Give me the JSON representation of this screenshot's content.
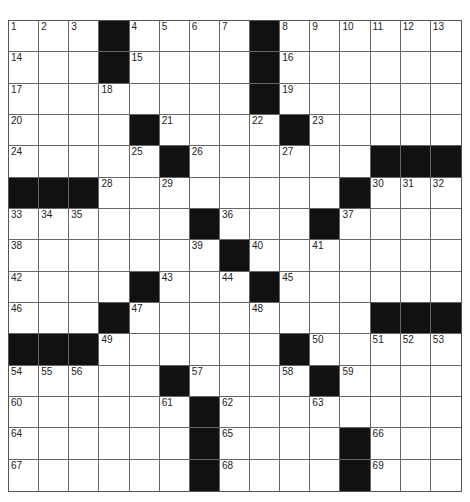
{
  "puzzle": {
    "rows": 15,
    "cols": 15,
    "colors": {
      "block": "#111111",
      "cell": "#ffffff",
      "line": "#666666"
    },
    "grid": [
      "...#....#......",
      "...#....#......",
      "........#......",
      "....#....#.....",
      ".....#......###",
      "###........#...",
      "......#...#....",
      ".......#.......",
      "....#...#......",
      "...#........###",
      "###......#.....",
      ".....#....#....",
      "......#........",
      "......#....#...",
      "......#....#..."
    ],
    "numbers": [
      {
        "r": 0,
        "c": 0,
        "n": "1"
      },
      {
        "r": 0,
        "c": 1,
        "n": "2"
      },
      {
        "r": 0,
        "c": 2,
        "n": "3"
      },
      {
        "r": 0,
        "c": 4,
        "n": "4"
      },
      {
        "r": 0,
        "c": 5,
        "n": "5"
      },
      {
        "r": 0,
        "c": 6,
        "n": "6"
      },
      {
        "r": 0,
        "c": 7,
        "n": "7"
      },
      {
        "r": 0,
        "c": 9,
        "n": "8"
      },
      {
        "r": 0,
        "c": 10,
        "n": "9"
      },
      {
        "r": 0,
        "c": 11,
        "n": "10"
      },
      {
        "r": 0,
        "c": 12,
        "n": "11"
      },
      {
        "r": 0,
        "c": 13,
        "n": "12"
      },
      {
        "r": 0,
        "c": 14,
        "n": "13"
      },
      {
        "r": 1,
        "c": 0,
        "n": "14"
      },
      {
        "r": 1,
        "c": 4,
        "n": "15"
      },
      {
        "r": 1,
        "c": 9,
        "n": "16"
      },
      {
        "r": 2,
        "c": 0,
        "n": "17"
      },
      {
        "r": 2,
        "c": 3,
        "n": "18"
      },
      {
        "r": 2,
        "c": 9,
        "n": "19"
      },
      {
        "r": 3,
        "c": 0,
        "n": "20"
      },
      {
        "r": 3,
        "c": 5,
        "n": "21"
      },
      {
        "r": 3,
        "c": 8,
        "n": "22"
      },
      {
        "r": 3,
        "c": 10,
        "n": "23"
      },
      {
        "r": 4,
        "c": 0,
        "n": "24"
      },
      {
        "r": 4,
        "c": 4,
        "n": "25"
      },
      {
        "r": 4,
        "c": 6,
        "n": "26"
      },
      {
        "r": 4,
        "c": 9,
        "n": "27"
      },
      {
        "r": 5,
        "c": 3,
        "n": "28"
      },
      {
        "r": 5,
        "c": 5,
        "n": "29"
      },
      {
        "r": 5,
        "c": 12,
        "n": "30"
      },
      {
        "r": 5,
        "c": 13,
        "n": "31"
      },
      {
        "r": 5,
        "c": 14,
        "n": "32"
      },
      {
        "r": 6,
        "c": 0,
        "n": "33"
      },
      {
        "r": 6,
        "c": 1,
        "n": "34"
      },
      {
        "r": 6,
        "c": 2,
        "n": "35"
      },
      {
        "r": 6,
        "c": 7,
        "n": "36"
      },
      {
        "r": 6,
        "c": 11,
        "n": "37"
      },
      {
        "r": 7,
        "c": 0,
        "n": "38"
      },
      {
        "r": 7,
        "c": 6,
        "n": "39"
      },
      {
        "r": 7,
        "c": 8,
        "n": "40"
      },
      {
        "r": 7,
        "c": 10,
        "n": "41"
      },
      {
        "r": 8,
        "c": 0,
        "n": "42"
      },
      {
        "r": 8,
        "c": 5,
        "n": "43"
      },
      {
        "r": 8,
        "c": 7,
        "n": "44"
      },
      {
        "r": 8,
        "c": 9,
        "n": "45"
      },
      {
        "r": 9,
        "c": 0,
        "n": "46"
      },
      {
        "r": 9,
        "c": 4,
        "n": "47"
      },
      {
        "r": 9,
        "c": 8,
        "n": "48"
      },
      {
        "r": 10,
        "c": 3,
        "n": "49"
      },
      {
        "r": 10,
        "c": 10,
        "n": "50"
      },
      {
        "r": 10,
        "c": 12,
        "n": "51"
      },
      {
        "r": 10,
        "c": 13,
        "n": "52"
      },
      {
        "r": 10,
        "c": 14,
        "n": "53"
      },
      {
        "r": 11,
        "c": 0,
        "n": "54"
      },
      {
        "r": 11,
        "c": 1,
        "n": "55"
      },
      {
        "r": 11,
        "c": 2,
        "n": "56"
      },
      {
        "r": 11,
        "c": 6,
        "n": "57"
      },
      {
        "r": 11,
        "c": 9,
        "n": "58"
      },
      {
        "r": 11,
        "c": 11,
        "n": "59"
      },
      {
        "r": 12,
        "c": 0,
        "n": "60"
      },
      {
        "r": 12,
        "c": 5,
        "n": "61"
      },
      {
        "r": 12,
        "c": 7,
        "n": "62"
      },
      {
        "r": 12,
        "c": 10,
        "n": "63"
      },
      {
        "r": 13,
        "c": 0,
        "n": "64"
      },
      {
        "r": 13,
        "c": 7,
        "n": "65"
      },
      {
        "r": 13,
        "c": 12,
        "n": "66"
      },
      {
        "r": 14,
        "c": 0,
        "n": "67"
      },
      {
        "r": 14,
        "c": 7,
        "n": "68"
      },
      {
        "r": 14,
        "c": 12,
        "n": "69"
      }
    ]
  }
}
